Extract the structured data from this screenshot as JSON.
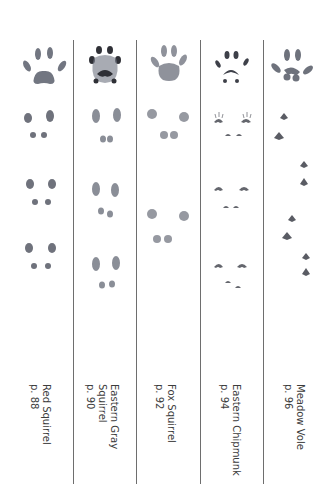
{
  "columns": [
    {
      "name_lines": [
        "Red Squirrel"
      ],
      "page": "p. 88",
      "track_style": "red-squirrel"
    },
    {
      "name_lines": [
        "Eastern Gray",
        "Squirrel"
      ],
      "page": "p. 90",
      "track_style": "gray-squirrel"
    },
    {
      "name_lines": [
        "Fox Squirrel"
      ],
      "page": "p. 92",
      "track_style": "fox-squirrel"
    },
    {
      "name_lines": [
        "Eastern Chipmunk"
      ],
      "page": "p. 94",
      "track_style": "chipmunk"
    },
    {
      "name_lines": [
        "Meadow Vole"
      ],
      "page": "p. 96",
      "track_style": "meadow-vole"
    }
  ],
  "colors": {
    "ink": "#555a66",
    "ink_dark": "#2f3036",
    "divider": "#6e6e6e",
    "text": "#3c3c3c"
  }
}
